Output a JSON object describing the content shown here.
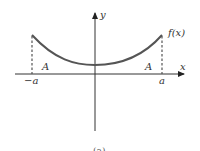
{
  "figure": {
    "caption": "(a)",
    "axes": {
      "x_label": "x",
      "y_label": "y"
    },
    "function_label": "f(x)",
    "ticks": {
      "left": "−a",
      "right": "a"
    },
    "area_labels": {
      "left": "A",
      "right": "A"
    },
    "colors": {
      "curve": "#555555",
      "axes": "#333333",
      "dashed": "#555555"
    }
  }
}
